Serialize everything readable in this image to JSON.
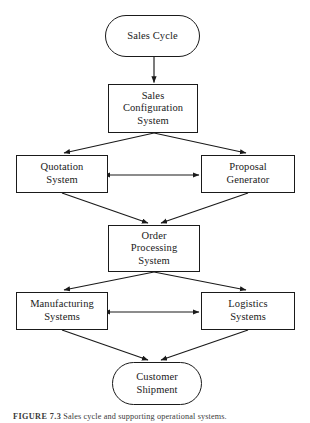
{
  "figure": {
    "caption_label": "FIGURE 7.3",
    "caption_text": "Sales cycle and supporting operational systems.",
    "line_color": "#1a1a1a",
    "background_color": "#ffffff"
  },
  "nodes": {
    "sales_cycle": {
      "shape": "terminal",
      "lines": [
        "Sales Cycle"
      ]
    },
    "sales_configuration_system": {
      "shape": "process",
      "lines": [
        "Sales",
        "Configuration",
        "System"
      ]
    },
    "quotation_system": {
      "shape": "process",
      "lines": [
        "Quotation",
        "System"
      ]
    },
    "proposal_generator": {
      "shape": "process",
      "lines": [
        "Proposal",
        "Generator"
      ]
    },
    "order_processing_system": {
      "shape": "process",
      "lines": [
        "Order",
        "Processing",
        "System"
      ]
    },
    "manufacturing_systems": {
      "shape": "process",
      "lines": [
        "Manufacturing",
        "Systems"
      ]
    },
    "logistics_systems": {
      "shape": "process",
      "lines": [
        "Logistics",
        "Systems"
      ]
    },
    "customer_shipment": {
      "shape": "terminal",
      "lines": [
        "Customer",
        "Shipment"
      ]
    }
  },
  "edges": [
    {
      "from": "sales_cycle",
      "to": "sales_configuration_system",
      "style": "single"
    },
    {
      "from": "sales_configuration_system",
      "to": "quotation_system",
      "style": "single"
    },
    {
      "from": "sales_configuration_system",
      "to": "proposal_generator",
      "style": "single"
    },
    {
      "from": "quotation_system",
      "to": "proposal_generator",
      "style": "double"
    },
    {
      "from": "quotation_system",
      "to": "order_processing_system",
      "style": "single"
    },
    {
      "from": "proposal_generator",
      "to": "order_processing_system",
      "style": "single"
    },
    {
      "from": "order_processing_system",
      "to": "manufacturing_systems",
      "style": "single"
    },
    {
      "from": "order_processing_system",
      "to": "logistics_systems",
      "style": "single"
    },
    {
      "from": "manufacturing_systems",
      "to": "logistics_systems",
      "style": "double"
    },
    {
      "from": "manufacturing_systems",
      "to": "customer_shipment",
      "style": "single"
    },
    {
      "from": "logistics_systems",
      "to": "customer_shipment",
      "style": "single"
    }
  ]
}
